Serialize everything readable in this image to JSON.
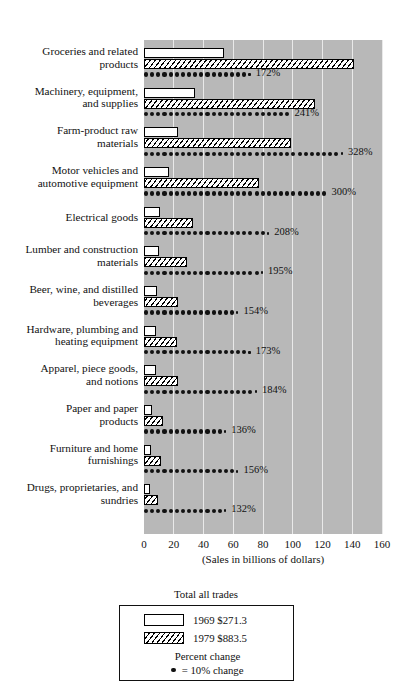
{
  "chart_data": {
    "type": "bar",
    "title": "",
    "xlabel": "(Sales in billions of dollars)",
    "ylabel": "",
    "xlim": [
      0,
      160
    ],
    "xticks": [
      0,
      20,
      40,
      60,
      80,
      100,
      120,
      140,
      160
    ],
    "xtick_labels": [
      "0",
      "20",
      "40",
      "60",
      "80",
      "100",
      "120",
      "140",
      "160"
    ],
    "grid": true,
    "legend_position": "bottom-center",
    "categories": [
      "Groceries and related products",
      "Machinery, equipment, and supplies",
      "Farm-product raw materials",
      "Motor vehicles and automotive equipment",
      "Electrical goods",
      "Lumber and construction materials",
      "Beer, wine, and distilled beverages",
      "Hardware, plumbing and heating equipment",
      "Apparel, piece goods, and notions",
      "Paper and paper products",
      "Furniture and home furnishings",
      "Drugs, proprietaries, and sundries"
    ],
    "series": [
      {
        "name": "1969",
        "values": [
          54,
          34,
          23,
          17,
          11,
          10,
          9,
          8,
          8,
          5.5,
          4.5,
          4
        ]
      },
      {
        "name": "1979",
        "values": [
          141,
          115,
          99,
          77,
          33,
          29,
          23,
          22,
          23,
          13,
          11.5,
          9.5
        ]
      }
    ],
    "percent_change": [
      172,
      241,
      328,
      300,
      208,
      195,
      154,
      173,
      184,
      136,
      156,
      132
    ],
    "percent_change_labels": [
      "172%",
      "241%",
      "328%",
      "300%",
      "208%",
      "195%",
      "154%",
      "173%",
      "184%",
      "136%",
      "156%",
      "132%"
    ],
    "dot_unit": 10
  },
  "categories": [
    {
      "line1": "Groceries and related",
      "line2": "products"
    },
    {
      "line1": "Machinery, equipment,",
      "line2": "and supplies"
    },
    {
      "line1": "Farm-product raw",
      "line2": "materials"
    },
    {
      "line1": "Motor vehicles and",
      "line2": "automotive equipment"
    },
    {
      "line1": "Electrical goods",
      "line2": ""
    },
    {
      "line1": "Lumber and construction",
      "line2": "materials"
    },
    {
      "line1": "Beer, wine, and distilled",
      "line2": "beverages"
    },
    {
      "line1": "Hardware, plumbing and",
      "line2": "heating equipment"
    },
    {
      "line1": "Apparel, piece goods,",
      "line2": "and notions"
    },
    {
      "line1": "Paper and paper",
      "line2": "products"
    },
    {
      "line1": "Furniture and home",
      "line2": "furnishings"
    },
    {
      "line1": "Drugs, proprietaries, and",
      "line2": "sundries"
    }
  ],
  "axis": {
    "title": "(Sales in billions of dollars)",
    "ticks": [
      "0",
      "20",
      "40",
      "60",
      "80",
      "100",
      "120",
      "140",
      "160"
    ]
  },
  "legend": {
    "title": "Total all trades",
    "row_1969": "1969 $271.3",
    "row_1979": "1979 $883.5",
    "percent_change_label": "Percent change",
    "dot_label": "= 10% change"
  },
  "colors": {
    "plot_background": "#b8b8b8",
    "gridline": "#e9e9e9",
    "bar_outline": "#000000",
    "bar_1969_fill": "#ffffff",
    "dot": "#111111",
    "page_background": "#ffffff"
  }
}
